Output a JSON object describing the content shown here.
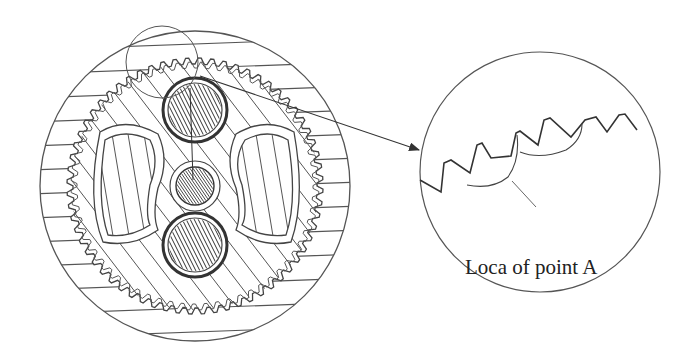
{
  "figure": {
    "colors": {
      "background": "#ffffff",
      "line": "#3a3a3a",
      "hatch": "#444444"
    },
    "main_view": {
      "center": [
        195,
        186
      ],
      "outer_radius": 155,
      "ring_gear_radius": 128,
      "ring_gear_teeth": 64,
      "components": [
        {
          "name": "top-planet-gear",
          "center": [
            195,
            110
          ],
          "radius": 32
        },
        {
          "name": "sun-gear",
          "center": [
            195,
            186
          ],
          "radius": 20
        },
        {
          "name": "bottom-planet-gear",
          "center": [
            195,
            245
          ],
          "radius": 32
        },
        {
          "name": "left-window",
          "side": "left"
        },
        {
          "name": "right-window",
          "side": "right"
        }
      ],
      "highlight_circle": {
        "center": [
          162,
          62
        ],
        "radius": 36
      }
    },
    "detail_view": {
      "center": [
        540,
        172
      ],
      "radius": 120,
      "label": "Loca of point A"
    },
    "arrow": {
      "from": [
        250,
        80
      ],
      "to": [
        420,
        150
      ]
    }
  }
}
